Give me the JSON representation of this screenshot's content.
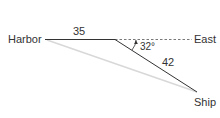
{
  "diagram": {
    "labels": {
      "harbor": "Harbor",
      "east": "East",
      "ship": "Ship",
      "side_harbor_turn": "35",
      "side_turn_ship": "42",
      "angle": "32°"
    },
    "colors": {
      "line": "#333333",
      "dashed": "#555555",
      "faint_line": "#d8d8d8",
      "text": "#333333"
    }
  }
}
